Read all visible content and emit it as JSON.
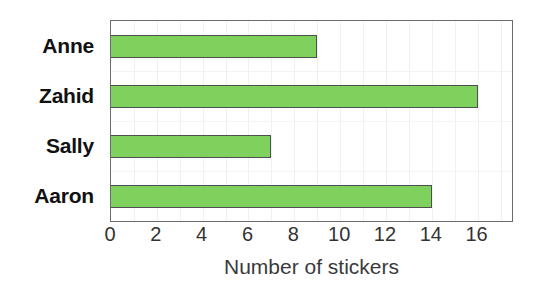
{
  "chart_data": {
    "type": "bar",
    "orientation": "horizontal",
    "title": "",
    "subtitle": "",
    "xlabel": "Number of stickers",
    "ylabel": "",
    "categories": [
      "Anne",
      "Zahid",
      "Sally",
      "Aaron"
    ],
    "values": [
      9,
      16,
      7,
      14
    ],
    "series": [
      {
        "name": "Number of stickers",
        "values": [
          9,
          16,
          7,
          14
        ]
      }
    ],
    "xlim": [
      0,
      17.5
    ],
    "xticks": [
      0,
      2,
      4,
      6,
      8,
      10,
      12,
      14,
      16
    ],
    "xtick_labels": [
      "0",
      "2",
      "4",
      "6",
      "8",
      "10",
      "12",
      "14",
      "16"
    ],
    "grid": true,
    "grid_axis": "x",
    "grid_step": 1,
    "legend": false,
    "legend_position": "none",
    "annotations": [],
    "colors": {
      "bar_fill": "#7ed15c",
      "bar_border": "#4f4f4f",
      "plot_border": "#6b6b6b",
      "gridline": "#f0f0ee",
      "category_label": "#111111",
      "tick_label": "#333333",
      "axis_title": "#3a3a3a",
      "background": "#ffffff"
    }
  }
}
